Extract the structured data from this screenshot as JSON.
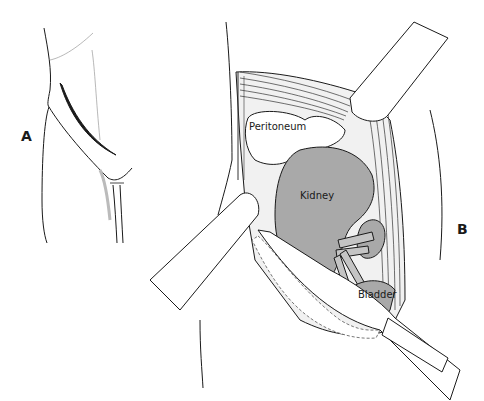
{
  "figure": {
    "panels": [
      {
        "id": "A",
        "label": "A",
        "description": "External view of flank with incision line"
      },
      {
        "id": "B",
        "label": "B",
        "description": "Exposed surgical field held by retractors"
      }
    ],
    "anatomy_labels": {
      "peritoneum": "Peritoneum",
      "kidney": "Kidney",
      "bladder": "Bladder"
    },
    "colors": {
      "line": "#1a1a1a",
      "organ_fill": "#a9a9a9",
      "tissue_fill": "#ffffff",
      "shading": "#cfcfcf"
    }
  }
}
